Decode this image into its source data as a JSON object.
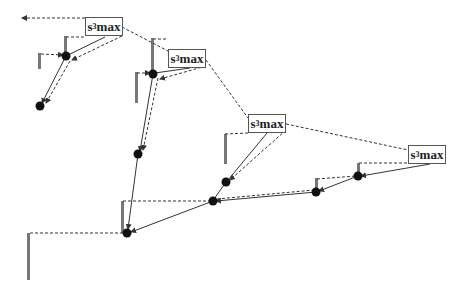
{
  "diagram": {
    "labels": [
      {
        "id": "box1",
        "prefix": "s",
        "sub": "3",
        "suffix": "max",
        "x": 85,
        "y": 17,
        "w": 38
      },
      {
        "id": "box2",
        "prefix": "s",
        "sub": "3",
        "suffix": "max",
        "x": 168,
        "y": 49,
        "w": 38
      },
      {
        "id": "box3",
        "prefix": "s",
        "sub": "3",
        "suffix": "max",
        "x": 248,
        "y": 114,
        "w": 38
      },
      {
        "id": "box4",
        "prefix": "s",
        "sub": "3",
        "suffix": "max",
        "x": 408,
        "y": 145,
        "w": 38
      }
    ],
    "nodes": [
      {
        "id": "A",
        "x": 66,
        "y": 56
      },
      {
        "id": "B",
        "x": 40,
        "y": 106
      },
      {
        "id": "C",
        "x": 153,
        "y": 74
      },
      {
        "id": "D",
        "x": 138,
        "y": 154
      },
      {
        "id": "E",
        "x": 226,
        "y": 182
      },
      {
        "id": "F",
        "x": 213,
        "y": 201
      },
      {
        "id": "G",
        "x": 358,
        "y": 176
      },
      {
        "id": "H",
        "x": 316,
        "y": 192
      },
      {
        "id": "I",
        "x": 127,
        "y": 233
      }
    ],
    "colors": {
      "line": "#333333",
      "bar": "#777777",
      "node": "#111111",
      "box_border": "#555555"
    }
  }
}
